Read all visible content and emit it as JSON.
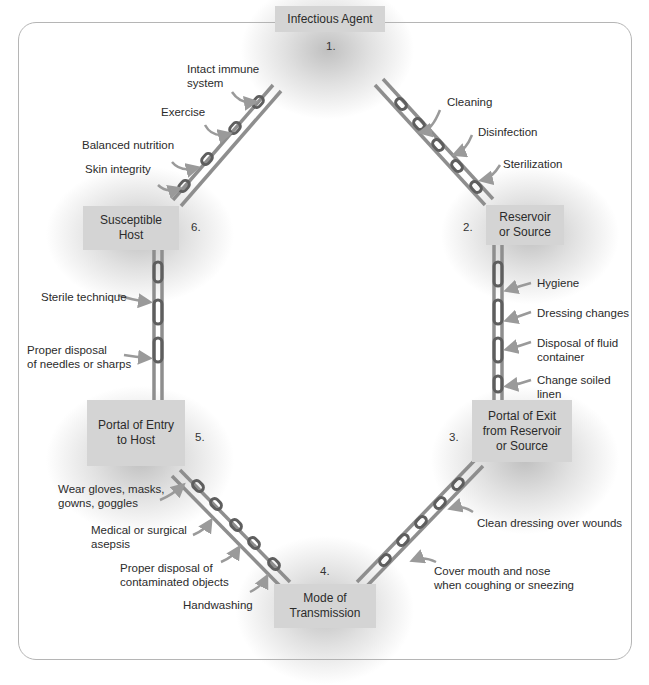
{
  "diagram": {
    "nodes": [
      {
        "number": "1.",
        "label": "Infectious Agent"
      },
      {
        "number": "2.",
        "label_line1": "Reservoir",
        "label_line2": "or Source"
      },
      {
        "number": "3.",
        "label_line1": "Portal of Exit",
        "label_line2": "from Reservoir",
        "label_line3": "or Source"
      },
      {
        "number": "4.",
        "label_line1": "Mode of",
        "label_line2": "Transmission"
      },
      {
        "number": "5.",
        "label_line1": "Portal of Entry",
        "label_line2": "to Host"
      },
      {
        "number": "6.",
        "label_line1": "Susceptible",
        "label_line2": "Host"
      }
    ],
    "links": {
      "host_to_agent": [
        {
          "line1": "Intact immune",
          "line2": "system"
        },
        {
          "line1": "Exercise"
        },
        {
          "line1": "Balanced nutrition"
        },
        {
          "line1": "Skin integrity"
        }
      ],
      "agent_to_reservoir": [
        {
          "line1": "Cleaning"
        },
        {
          "line1": "Disinfection"
        },
        {
          "line1": "Sterilization"
        }
      ],
      "reservoir_to_exit": [
        {
          "line1": "Hygiene"
        },
        {
          "line1": "Dressing changes"
        },
        {
          "line1": "Disposal of fluid",
          "line2": "container"
        },
        {
          "line1": "Change soiled",
          "line2": "linen"
        }
      ],
      "exit_to_transmission": [
        {
          "line1": "Clean dressing over wounds"
        },
        {
          "line1": "Cover mouth and nose",
          "line2": "when coughing or sneezing"
        }
      ],
      "transmission_to_entry": [
        {
          "line1": "Wear gloves, masks,",
          "line2": "gowns, goggles"
        },
        {
          "line1": "Medical or surgical",
          "line2": "asepsis"
        },
        {
          "line1": "Proper disposal of",
          "line2": "contaminated objects"
        },
        {
          "line1": "Handwashing"
        }
      ],
      "entry_to_host": [
        {
          "line1": "Sterile technique"
        },
        {
          "line1": "Proper disposal",
          "line2": "of needles or sharps"
        }
      ]
    },
    "colors": {
      "node_fill": "#d4d4d4",
      "chain_rail": "#8e8e8e",
      "chain_link": "#5e5e5e",
      "arrow": "#9a9a9a",
      "frame_border": "#b5b5b5"
    }
  }
}
